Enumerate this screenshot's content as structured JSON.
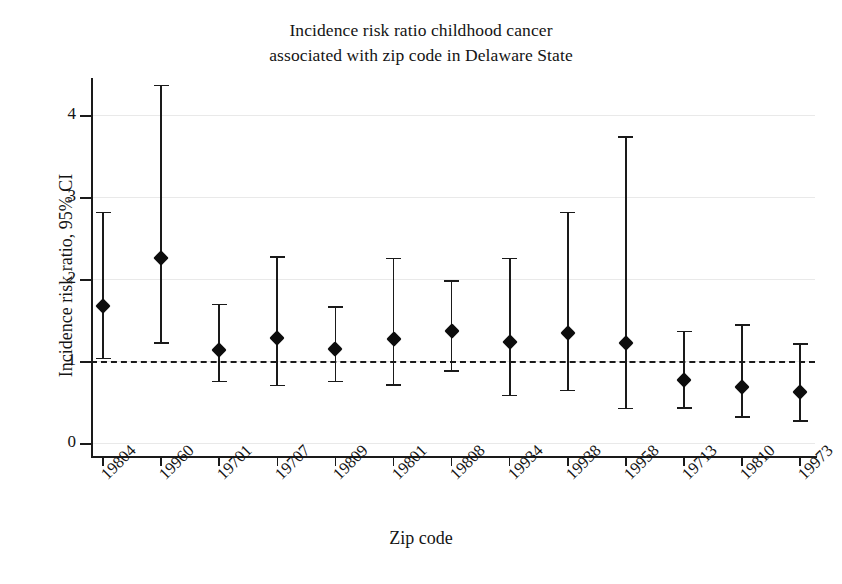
{
  "chart_data": {
    "type": "scatter",
    "title": "Incidence risk ratio childhood cancer associated with zip code in Delaware State",
    "title_line1": "Incidence risk ratio childhood cancer",
    "title_line2": "associated with zip code in Delaware State",
    "xlabel": "Zip code",
    "ylabel": "Incidence risk ratio, 95% CI",
    "ylim": [
      0,
      4.55
    ],
    "yticks": [
      0,
      1,
      2,
      3,
      4
    ],
    "ytick_labels": [
      "0",
      "1",
      "2",
      "3",
      "4"
    ],
    "grid": "horizontal",
    "legend": "none",
    "reference_line": 1.0,
    "reference_line_style": "dashed",
    "marker": "diamond",
    "marker_color": "#0d0d0d",
    "line_color": "#1a1a1a",
    "categories": [
      "19804",
      "19960",
      "19701",
      "19707",
      "19809",
      "19801",
      "19808",
      "19934",
      "19938",
      "19958",
      "19713",
      "19810",
      "19973"
    ],
    "values": [
      1.67,
      2.26,
      1.13,
      1.28,
      1.15,
      1.27,
      1.37,
      1.23,
      1.34,
      1.22,
      0.77,
      0.68,
      0.62
    ],
    "ci_lower": [
      1.04,
      1.23,
      0.76,
      0.71,
      0.76,
      0.72,
      0.89,
      0.59,
      0.65,
      0.43,
      0.44,
      0.33,
      0.28
    ],
    "ci_upper": [
      2.82,
      4.37,
      1.7,
      2.28,
      1.67,
      2.26,
      1.99,
      2.26,
      2.82,
      3.74,
      1.37,
      1.45,
      1.22
    ],
    "points": [
      {
        "zip": "19804",
        "irr": 1.67,
        "lcl": 1.04,
        "ucl": 2.82
      },
      {
        "zip": "19960",
        "irr": 2.26,
        "lcl": 1.23,
        "ucl": 4.37
      },
      {
        "zip": "19701",
        "irr": 1.13,
        "lcl": 0.76,
        "ucl": 1.7
      },
      {
        "zip": "19707",
        "irr": 1.28,
        "lcl": 0.71,
        "ucl": 2.28
      },
      {
        "zip": "19809",
        "irr": 1.15,
        "lcl": 0.76,
        "ucl": 1.67
      },
      {
        "zip": "19801",
        "irr": 1.27,
        "lcl": 0.72,
        "ucl": 2.26
      },
      {
        "zip": "19808",
        "irr": 1.37,
        "lcl": 0.89,
        "ucl": 1.99
      },
      {
        "zip": "19934",
        "irr": 1.23,
        "lcl": 0.59,
        "ucl": 2.26
      },
      {
        "zip": "19938",
        "irr": 1.34,
        "lcl": 0.65,
        "ucl": 2.82
      },
      {
        "zip": "19958",
        "irr": 1.22,
        "lcl": 0.43,
        "ucl": 3.74
      },
      {
        "zip": "19713",
        "irr": 0.77,
        "lcl": 0.44,
        "ucl": 1.37
      },
      {
        "zip": "19810",
        "irr": 0.68,
        "lcl": 0.33,
        "ucl": 1.45
      },
      {
        "zip": "19973",
        "irr": 0.62,
        "lcl": 0.28,
        "ucl": 1.22
      }
    ]
  }
}
